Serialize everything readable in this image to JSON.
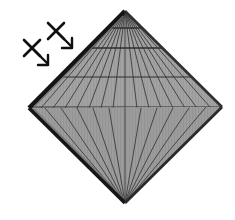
{
  "image": {
    "width": 235,
    "height": 220,
    "background_color": "#ffffff",
    "title": "Diamond-shaped radial mesh dome with directional annotation arrows"
  },
  "figure": {
    "name": "rhombus-dome-mesh",
    "description": "Rhombus / diamond silhouette of a segmented dome (umbrella-like) seen edge-on, with radial ribs converging at top and bottom apexes and horizontal ring lines across the upper half",
    "apex_top": {
      "x": 125,
      "y": 11
    },
    "apex_bottom": {
      "x": 125,
      "y": 203
    },
    "vertex_left": {
      "x": 29,
      "y": 108
    },
    "vertex_right": {
      "x": 222,
      "y": 107
    },
    "fill_color": "#9c9c9c",
    "fill_color_upper": "#a2a2a2",
    "fill_color_lower": "#989898",
    "outline_color": "#1a1a1a",
    "outline_color_light": "#4a4a4a",
    "outline_width": 4,
    "rib_color": "#3c3c3c",
    "rib_width": 0.9,
    "ring_color": "#2e2e2e",
    "ring_width": 1.1,
    "texture_color": "#8e8e8e",
    "rib_count_upper": 17,
    "rib_count_lower": 13,
    "rings": [
      {
        "label": "ring-1",
        "y": 28
      },
      {
        "label": "ring-2",
        "y": 48
      },
      {
        "label": "ring-3",
        "y": 77
      },
      {
        "label": "ring-4",
        "y": 107
      }
    ]
  },
  "annotations": {
    "label": "direction-markers",
    "color": "#111111",
    "stroke_width": 2.6,
    "markers": [
      {
        "name": "x-arrow-marker-upper",
        "cross_center": {
          "x": 56,
          "y": 31
        },
        "cross_size": 9,
        "arrow_start": {
          "x": 58,
          "y": 33
        },
        "arrow_end": {
          "x": 72,
          "y": 47
        },
        "arrow_head_size": 8
      },
      {
        "name": "x-arrow-marker-lower",
        "cross_center": {
          "x": 32,
          "y": 48
        },
        "cross_size": 9,
        "arrow_start": {
          "x": 34,
          "y": 50
        },
        "arrow_end": {
          "x": 48,
          "y": 64
        },
        "arrow_head_size": 8
      }
    ]
  },
  "chart_data": {
    "type": "diagram",
    "shape": "rhombus",
    "segments_top": 16,
    "segments_bottom": 12,
    "rings": 4
  }
}
